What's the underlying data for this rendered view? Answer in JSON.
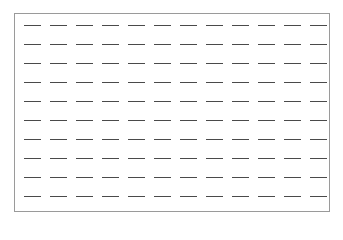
{
  "figure": {
    "rows": 10,
    "columns": 12,
    "element": "horizontal-dash",
    "dash_color": "#4a4a4a",
    "border_color": "#9a9a9a",
    "background": "#ffffff"
  }
}
